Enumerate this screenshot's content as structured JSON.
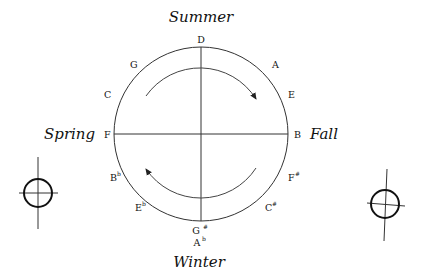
{
  "seasons": {
    "top": "Summer",
    "right": "Fall",
    "bottom": "Winter",
    "left": "Spring"
  },
  "notes": {
    "top": "D",
    "top_right_1": "A",
    "top_right_2": "E",
    "right": "B",
    "bottom_right_1": "F",
    "bottom_right_1_acc": "#",
    "bottom_right_2": "C",
    "bottom_right_2_acc": "#",
    "bottom_1": "G",
    "bottom_1_acc": "#",
    "bottom_2": "A",
    "bottom_2_acc": "b",
    "bottom_left_2": "E",
    "bottom_left_2_acc": "b",
    "bottom_left_1": "B",
    "bottom_left_1_acc": "b",
    "left": "F",
    "top_left_2": "C",
    "top_left_1": "G"
  },
  "arrows": {
    "top_direction": "clockwise",
    "bottom_direction": "clockwise"
  },
  "symbols": [
    "circled-cross-left",
    "circled-cross-right"
  ]
}
